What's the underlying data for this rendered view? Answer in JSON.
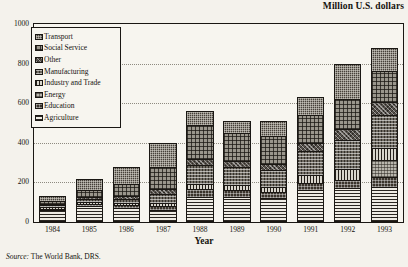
{
  "chart_data": {
    "type": "bar",
    "subtype": "stacked-bar",
    "title": "Million U.S. dollars",
    "xlabel": "Year",
    "ylabel": "",
    "ylim": [
      0,
      1000
    ],
    "yticks": [
      0,
      200,
      400,
      600,
      800,
      1000
    ],
    "grid": true,
    "legend_position": "upper-left-inside",
    "source": "The World Bank, DRS.",
    "source_prefix": "Source:",
    "categories": [
      "1984",
      "1985",
      "1986",
      "1987",
      "1988",
      "1989",
      "1990",
      "1991",
      "1992",
      "1993"
    ],
    "series": [
      {
        "name": "Agriculture",
        "pattern": "horizontal-lines",
        "values": [
          62,
          82,
          70,
          62,
          128,
          128,
          120,
          160,
          172,
          178
        ]
      },
      {
        "name": "Education",
        "pattern": "fine-grid-dark",
        "values": [
          6,
          10,
          14,
          18,
          40,
          36,
          32,
          36,
          42,
          48
        ]
      },
      {
        "name": "Energy",
        "pattern": "light-grid",
        "values": [
          0,
          0,
          0,
          0,
          0,
          0,
          0,
          0,
          0,
          86
        ]
      },
      {
        "name": "Industry and Trade",
        "pattern": "vertical-lines",
        "values": [
          6,
          8,
          10,
          14,
          22,
          24,
          26,
          42,
          52,
          60
        ]
      },
      {
        "name": "Manufacturing",
        "pattern": "cross-hatch-medium",
        "values": [
          10,
          16,
          22,
          50,
          96,
          88,
          86,
          120,
          150,
          170
        ]
      },
      {
        "name": "Other",
        "pattern": "diagonal-cross",
        "values": [
          8,
          12,
          16,
          24,
          34,
          32,
          30,
          42,
          56,
          62
        ]
      },
      {
        "name": "Social Service",
        "pattern": "open-grid",
        "values": [
          14,
          34,
          58,
          112,
          168,
          140,
          140,
          140,
          150,
          160
        ]
      },
      {
        "name": "Transport",
        "pattern": "dense-checker",
        "values": [
          24,
          58,
          90,
          120,
          72,
          62,
          76,
          90,
          178,
          116
        ]
      }
    ],
    "totals": [
      130,
      220,
      280,
      400,
      560,
      510,
      510,
      630,
      800,
      880
    ]
  },
  "legend": {
    "items": [
      {
        "label": "Transport"
      },
      {
        "label": "Social Service"
      },
      {
        "label": "Other"
      },
      {
        "label": "Manufacturing"
      },
      {
        "label": "Industry and Trade"
      },
      {
        "label": "Energy"
      },
      {
        "label": "Education"
      },
      {
        "label": "Agriculture"
      }
    ]
  }
}
